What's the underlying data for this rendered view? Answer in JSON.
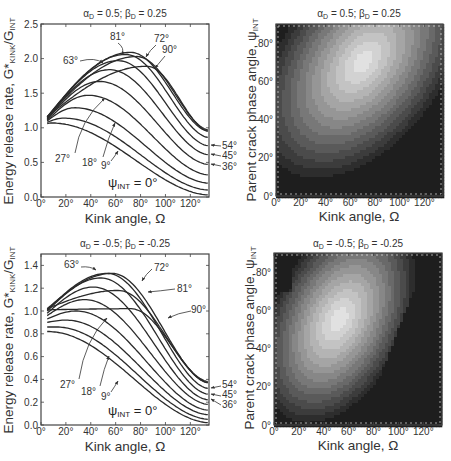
{
  "chart_data": [
    {
      "id": "top-left",
      "type": "line",
      "title": "αD = 0.5; βD = 0.25",
      "xlabel": "Kink angle, Ω",
      "ylabel": "Energy release rate, G*KINK/GINT",
      "xlim": [
        0,
        135
      ],
      "ylim": [
        0.0,
        2.5
      ],
      "xticks": [
        "0°",
        "20°",
        "40°",
        "60°",
        "80°",
        "100°",
        "120°"
      ],
      "yticks": [
        "0.0",
        "0.5",
        "1.0",
        "1.5",
        "2.0",
        "2.5"
      ],
      "grid": false,
      "annotation": "ψINT = 0°",
      "series_param": "ψINT",
      "series": [
        {
          "name": "0°",
          "peak_x": 8,
          "peak_y": 1.07,
          "start_y": 1.06,
          "end_y": 0.03
        },
        {
          "name": "9°",
          "peak_x": 18,
          "peak_y": 1.14,
          "start_y": 1.08,
          "end_y": 0.1
        },
        {
          "name": "18°",
          "peak_x": 27,
          "peak_y": 1.29,
          "start_y": 1.1,
          "end_y": 0.2
        },
        {
          "name": "27°",
          "peak_x": 38,
          "peak_y": 1.47,
          "start_y": 1.11,
          "end_y": 0.32
        },
        {
          "name": "36°",
          "peak_x": 47,
          "peak_y": 1.67,
          "start_y": 1.12,
          "end_y": 0.47
        },
        {
          "name": "45°",
          "peak_x": 55,
          "peak_y": 1.84,
          "start_y": 1.13,
          "end_y": 0.61
        },
        {
          "name": "54°",
          "peak_x": 62,
          "peak_y": 1.97,
          "start_y": 1.14,
          "end_y": 0.74
        },
        {
          "name": "63°",
          "peak_x": 68,
          "peak_y": 2.06,
          "start_y": 1.15,
          "end_y": 0.86
        },
        {
          "name": "72°",
          "peak_x": 72,
          "peak_y": 2.09,
          "start_y": 1.16,
          "end_y": 0.95
        },
        {
          "name": "81°",
          "peak_x": 77,
          "peak_y": 2.03,
          "start_y": 1.16,
          "end_y": 0.97
        },
        {
          "name": "90°",
          "peak_x": 85,
          "peak_y": 1.89,
          "start_y": 1.16,
          "end_y": 0.95
        }
      ]
    },
    {
      "id": "top-right",
      "type": "heatmap",
      "title": "αD = 0.5; βD = 0.25",
      "xlabel": "Kink angle, Ω",
      "ylabel": "Parent crack phase angle, ψINT",
      "xlim": [
        0,
        135
      ],
      "ylim": [
        0,
        90
      ],
      "xticks": [
        "0°",
        "20°",
        "40°",
        "60°",
        "80°",
        "100°",
        "120°"
      ],
      "yticks": [
        "0°",
        "20°",
        "40°",
        "60°",
        "80°"
      ],
      "maximum_location": {
        "x": 70,
        "y": 70
      },
      "colormap": "grayscale (light = high)"
    },
    {
      "id": "bottom-left",
      "type": "line",
      "title": "αD = -0.5; βD = -0.25",
      "xlabel": "Kink angle, Ω",
      "ylabel": "Energy release rate, G*KINK/GINT",
      "xlim": [
        0,
        135
      ],
      "ylim": [
        0.0,
        1.5
      ],
      "xticks": [
        "0°",
        "20°",
        "40°",
        "60°",
        "80°",
        "100°",
        "120°"
      ],
      "yticks": [
        "0.0",
        "0.2",
        "0.4",
        "0.6",
        "0.8",
        "1.0",
        "1.2",
        "1.4"
      ],
      "grid": false,
      "annotation": "ψINT = 0°",
      "series_param": "ψINT",
      "series": [
        {
          "name": "0°",
          "peak_x": 5,
          "peak_y": 0.82,
          "start_y": 0.82,
          "end_y": 0.02
        },
        {
          "name": "9°",
          "peak_x": 12,
          "peak_y": 0.86,
          "start_y": 0.86,
          "end_y": 0.05
        },
        {
          "name": "18°",
          "peak_x": 20,
          "peak_y": 0.92,
          "start_y": 0.9,
          "end_y": 0.09
        },
        {
          "name": "27°",
          "peak_x": 28,
          "peak_y": 1.0,
          "start_y": 0.93,
          "end_y": 0.13
        },
        {
          "name": "36°",
          "peak_x": 35,
          "peak_y": 1.1,
          "start_y": 0.96,
          "end_y": 0.18
        },
        {
          "name": "45°",
          "peak_x": 42,
          "peak_y": 1.21,
          "start_y": 0.98,
          "end_y": 0.22
        },
        {
          "name": "54°",
          "peak_x": 48,
          "peak_y": 1.29,
          "start_y": 1.0,
          "end_y": 0.27
        },
        {
          "name": "63°",
          "peak_x": 53,
          "peak_y": 1.33,
          "start_y": 1.01,
          "end_y": 0.32
        },
        {
          "name": "72°",
          "peak_x": 57,
          "peak_y": 1.33,
          "start_y": 1.02,
          "end_y": 0.37
        },
        {
          "name": "81°",
          "peak_x": 62,
          "peak_y": 1.18,
          "start_y": 1.02,
          "end_y": 0.38
        },
        {
          "name": "90°",
          "peak_x": 72,
          "peak_y": 1.02,
          "start_y": 1.01,
          "end_y": 0.37
        }
      ]
    },
    {
      "id": "bottom-right",
      "type": "heatmap",
      "title": "αD = -0.5; βD = -0.25",
      "xlabel": "Kink angle, Ω",
      "ylabel": "Parent crack phase angle, ψINT",
      "xlim": [
        0,
        135
      ],
      "ylim": [
        0,
        90
      ],
      "xticks": [
        "0°",
        "20°",
        "40°",
        "60°",
        "80°",
        "100°",
        "120°"
      ],
      "yticks": [
        "0°",
        "20°",
        "40°",
        "60°",
        "80°"
      ],
      "maximum_location": {
        "x": 52,
        "y": 55
      },
      "colormap": "grayscale (light = high)"
    }
  ],
  "panels": {
    "tl": {
      "title_a": "α",
      "title_sub_a": "D",
      "title_mid": " = 0.5; β",
      "title_sub_b": "D",
      "title_end": " = 0.25",
      "ylabel_main": "Energy release rate, G*",
      "ylabel_sub1": "KINK",
      "ylabel_mid": "/G",
      "ylabel_sub2": "INT",
      "xlabel": "Kink angle, Ω",
      "psi_main": "ψ",
      "psi_sub": "INT",
      "psi_end": " = 0°",
      "labels": {
        "l63": "63°",
        "l81": "81°",
        "l72": "72°",
        "l90": "90°",
        "l27": "27°",
        "l18": "18°",
        "l9": "9°",
        "l54": "54°",
        "l45": "45°",
        "l36": "36°"
      }
    },
    "tr": {
      "title_a": "α",
      "title_sub_a": "D",
      "title_mid": " = 0.5; β",
      "title_sub_b": "D",
      "title_end": " = 0.25",
      "ylabel_main": "Parent crack phase angle, ψ",
      "ylabel_sub": "INT",
      "xlabel": "Kink angle, Ω"
    },
    "bl": {
      "title_a": "α",
      "title_sub_a": "D",
      "title_mid": " = -0.5; β",
      "title_sub_b": "D",
      "title_end": " = -0.25",
      "ylabel_main": "Energy release rate, G*",
      "ylabel_sub1": "KINK",
      "ylabel_mid": "/G",
      "ylabel_sub2": "INT",
      "xlabel": "Kink angle, Ω",
      "psi_main": "ψ",
      "psi_sub": "INT",
      "psi_end": " = 0°",
      "labels": {
        "l63": "63°",
        "l72": "72°",
        "l81": "81°",
        "l90": "90°",
        "l27": "27°",
        "l18": "18°",
        "l9": "9°",
        "l54": "54°",
        "l45": "45°",
        "l36": "36°"
      }
    },
    "br": {
      "title_a": "α",
      "title_sub_a": "D",
      "title_mid": " = -0.5; β",
      "title_sub_b": "D",
      "title_end": " = -0.25",
      "ylabel_main": "Parent crack phase angle, ψ",
      "ylabel_sub": "INT",
      "xlabel": "Kink angle, Ω"
    }
  },
  "ticks": {
    "x": [
      "0°",
      "20°",
      "40°",
      "60°",
      "80°",
      "100°",
      "120°"
    ],
    "y_tl": [
      "0.0",
      "0.5",
      "1.0",
      "1.5",
      "2.0",
      "2.5"
    ],
    "y_bl": [
      "0.0",
      "0.2",
      "0.4",
      "0.6",
      "0.8",
      "1.0",
      "1.2",
      "1.4"
    ],
    "y_contour": [
      "0°",
      "20°",
      "40°",
      "60°",
      "80°"
    ]
  }
}
